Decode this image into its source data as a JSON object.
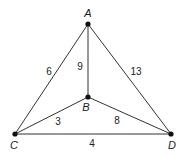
{
  "diagram": {
    "type": "weighted-graph",
    "vertices": [
      {
        "id": "A",
        "label": "A",
        "x": 88,
        "y": 24,
        "lx": 88,
        "ly": 17
      },
      {
        "id": "B",
        "label": "B",
        "x": 88,
        "y": 97,
        "lx": 86,
        "ly": 111
      },
      {
        "id": "C",
        "label": "C",
        "x": 15,
        "y": 134,
        "lx": 14,
        "ly": 149
      },
      {
        "id": "D",
        "label": "D",
        "x": 171,
        "y": 134,
        "lx": 172,
        "ly": 149
      }
    ],
    "edges": [
      {
        "from": "A",
        "to": "C",
        "weight": "6",
        "lx": 49,
        "ly": 75
      },
      {
        "from": "A",
        "to": "B",
        "weight": "9",
        "lx": 80,
        "ly": 70
      },
      {
        "from": "A",
        "to": "D",
        "weight": "13",
        "lx": 136,
        "ly": 75
      },
      {
        "from": "B",
        "to": "C",
        "weight": "3",
        "lx": 58,
        "ly": 125
      },
      {
        "from": "B",
        "to": "D",
        "weight": "8",
        "lx": 117,
        "ly": 124
      },
      {
        "from": "C",
        "to": "D",
        "weight": "4",
        "lx": 92,
        "ly": 147
      }
    ]
  }
}
